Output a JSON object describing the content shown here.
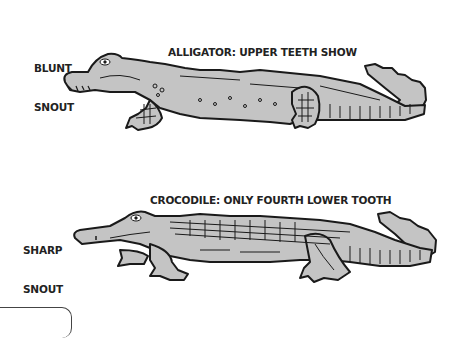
{
  "alligator": {
    "caption_line1": "ALLIGATOR: UPPER TEETH SHOW",
    "caption_line2": "WHEN MOUTH IS SHUT",
    "snout_line1": "BLUNT",
    "snout_line2": "SNOUT"
  },
  "crocodile": {
    "caption_line1": "CROCODILE: ONLY FOURTH LOWER TOOTH",
    "caption_line2": "SHOWS WHEN MOUTH IS SHUT",
    "snout_line1": "SHARP",
    "snout_line2": "SNOUT"
  },
  "colors": {
    "body_fill": "#c4c4c4",
    "outline": "#1a1a1a",
    "text": "#222222"
  }
}
